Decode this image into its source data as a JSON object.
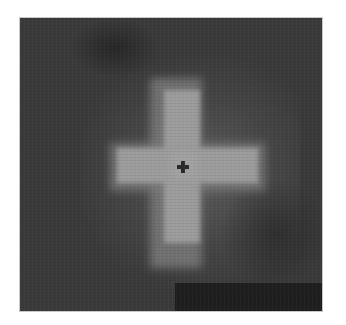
{
  "image": {
    "description": "Grayscale image of a blurred, blocky bright cross (plus) shape on a dark noisy background with a small dark plus marker at the center",
    "colors": {
      "background": "#3a3a3a",
      "cross": "#9c9c9c",
      "marker": "#2a2a2a",
      "dark_band": "#1e1e1e",
      "page": "#ffffff"
    },
    "frame": {
      "x": 20,
      "y": 18,
      "width": 302,
      "height": 293
    },
    "center_marker": {
      "x": 183,
      "y": 167,
      "shape": "plus"
    }
  }
}
